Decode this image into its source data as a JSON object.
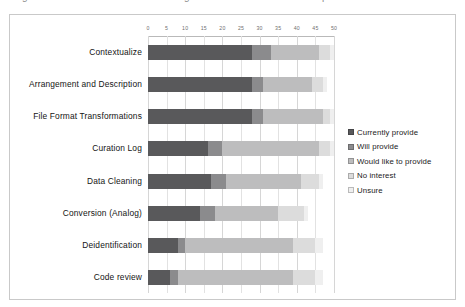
{
  "page": {
    "top_cut_text": [
      "g",
      "rr",
      "g",
      "p"
    ]
  },
  "chart_data": {
    "type": "bar",
    "orientation": "horizontal",
    "stacked": true,
    "title": "",
    "xlabel": "",
    "ylabel": "",
    "xlim": [
      0,
      50
    ],
    "grid": true,
    "legend_position": "right",
    "xticks": [
      0,
      5,
      10,
      15,
      20,
      25,
      30,
      35,
      40,
      45,
      50
    ],
    "xtick_labels": [
      "0",
      "5",
      "10",
      "15",
      "20",
      "25",
      "30",
      "35",
      "40",
      "45",
      "50"
    ],
    "categories": [
      "Contextualize",
      "Arrangement and Description",
      "File Format Transformations",
      "Curation Log",
      "Data Cleaning",
      "Conversion (Analog)",
      "Deidentification",
      "Code review"
    ],
    "series": [
      {
        "name": "Currently provide",
        "color": "#59595b",
        "values": [
          28,
          28,
          28,
          16,
          17,
          14,
          8,
          6
        ]
      },
      {
        "name": "Will provide",
        "color": "#8b8b8d",
        "values": [
          5,
          3,
          3,
          4,
          4,
          4,
          2,
          2
        ]
      },
      {
        "name": "Would like to provide",
        "color": "#bdbdbe",
        "values": [
          13,
          13,
          16,
          26,
          20,
          17,
          29,
          31
        ]
      },
      {
        "name": "No interest",
        "color": "#dcdcdc",
        "values": [
          3,
          3,
          2,
          3,
          5,
          7,
          6,
          6
        ]
      },
      {
        "name": "Unsure",
        "color": "#efefef",
        "values": [
          1,
          1,
          1,
          1,
          1,
          1,
          2,
          2
        ]
      }
    ]
  },
  "legend": {
    "items": [
      {
        "label": "Currently provide",
        "color": "#59595b"
      },
      {
        "label": "Will provide",
        "color": "#8b8b8d"
      },
      {
        "label": "Would like to provide",
        "color": "#bdbdbe"
      },
      {
        "label": "No interest",
        "color": "#dcdcdc"
      },
      {
        "label": "Unsure",
        "color": "#efefef"
      }
    ]
  }
}
